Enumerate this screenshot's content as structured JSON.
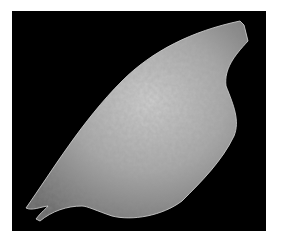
{
  "image": {
    "subject": "bone fragment specimen",
    "background_color": "#000000",
    "frame_color": "#ffffff"
  }
}
